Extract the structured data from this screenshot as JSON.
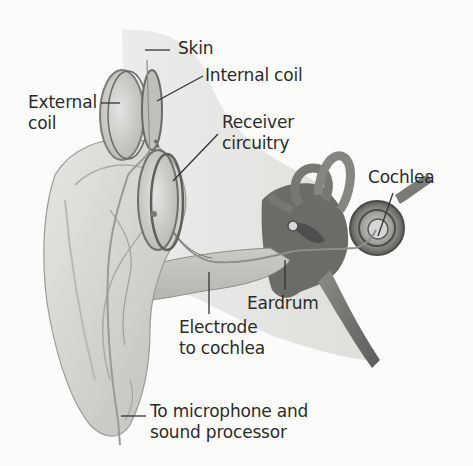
{
  "diagram": {
    "labels": {
      "skin": "Skin",
      "internal_coil": "Internal coil",
      "external_coil_line1": "External",
      "external_coil_line2": "coil",
      "receiver_line1": "Receiver",
      "receiver_line2": "circuitry",
      "cochlea": "Cochlea",
      "eardrum": "Eardrum",
      "electrode_line1": "Electrode",
      "electrode_line2": "to cochlea",
      "microphone_line1": "To microphone and",
      "microphone_line2": "sound processor"
    },
    "colors": {
      "background": "#fbfbfa",
      "text": "#2b2b2b",
      "leader_line": "#333333",
      "skin_tone_light": "#e4e4e2",
      "skin_tone_mid": "#c9c9c6",
      "skin_tone_dark": "#8e8e8b",
      "inner_ear_dark": "#5a5a58"
    }
  }
}
